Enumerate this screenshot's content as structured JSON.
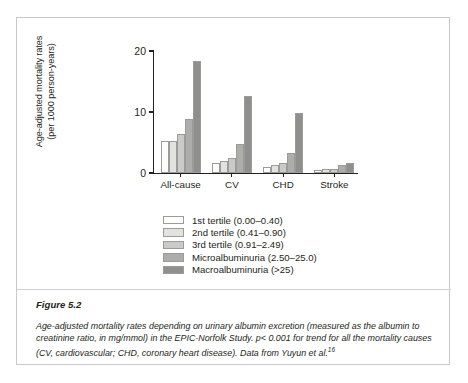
{
  "figure": {
    "number_label": "Figure 5.2",
    "caption": "Age-adjusted mortality rates depending on urinary albumin excretion (measured as the albumin to creatinine ratio, in mg/mmol) in the EPIC-Norfolk Study. p< 0.001 for trend for all the mortality causes (CV, cardiovascular; CHD, coronary heart disease). Data from Yuyun et al.",
    "caption_reference": "16"
  },
  "chart_data": {
    "type": "bar",
    "title": "",
    "xlabel": "",
    "ylabel": "Age-adjusted mortality rates\n(per 1000 person-years)",
    "ylim": [
      0,
      20
    ],
    "yticks": [
      0,
      10,
      20
    ],
    "ytick_labels": [
      "0",
      "10",
      "20"
    ],
    "grid": false,
    "legend_position": "below",
    "categories": [
      "All-cause",
      "CV",
      "CHD",
      "Stroke"
    ],
    "series": [
      {
        "name": "1st tertile (0.00–0.40)",
        "color": "#fdfdfb",
        "values": [
          5.3,
          1.6,
          1.0,
          0.5
        ]
      },
      {
        "name": "2nd tertile (0.41–0.90)",
        "color": "#e2e2de",
        "values": [
          5.3,
          2.0,
          1.3,
          0.6
        ]
      },
      {
        "name": "3rd tertile (0.91–2.49)",
        "color": "#cacac6",
        "values": [
          6.4,
          2.5,
          1.7,
          0.7
        ]
      },
      {
        "name": "Microalbuminuria (2.50–25.0)",
        "color": "#adadaa",
        "values": [
          8.8,
          4.7,
          3.3,
          1.3
        ]
      },
      {
        "name": "Macroalbuminuria (>25)",
        "color": "#8f8f8d",
        "values": [
          18.3,
          12.7,
          9.8,
          1.7
        ]
      }
    ]
  }
}
